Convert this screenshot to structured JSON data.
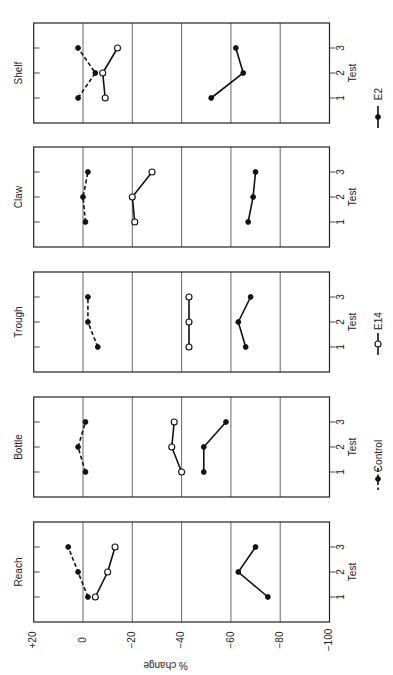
{
  "chart_data": {
    "type": "line",
    "orientation": "rotated-90-clockwise",
    "title": "",
    "ylabel": "% change",
    "xlabel": "Test",
    "ylim": [
      -100,
      20
    ],
    "y_ticks": [
      20,
      0,
      -20,
      -40,
      -60,
      -80,
      -100
    ],
    "y_tick_labels": [
      "+20",
      "0",
      "−20",
      "−40",
      "−60",
      "−80",
      "−100"
    ],
    "x_ticks": [
      1,
      2,
      3
    ],
    "x_tick_labels": [
      "1",
      "2",
      "3"
    ],
    "grid": true,
    "legend_position": "right (rotated bottom)",
    "legend": [
      {
        "name": "Control",
        "style": "dashed",
        "marker": "filled-circle"
      },
      {
        "name": "E14",
        "style": "solid",
        "marker": "open-circle"
      },
      {
        "name": "E2",
        "style": "solid",
        "marker": "filled-circle"
      }
    ],
    "panels": [
      {
        "name": "Shelf",
        "series": [
          {
            "name": "Control",
            "values": [
              2,
              -5,
              2
            ]
          },
          {
            "name": "E14",
            "values": [
              -9,
              -8,
              -14
            ]
          },
          {
            "name": "E2",
            "values": [
              -52,
              -65,
              -62
            ]
          }
        ]
      },
      {
        "name": "Claw",
        "series": [
          {
            "name": "Control",
            "values": [
              -1,
              0,
              -2
            ]
          },
          {
            "name": "E14",
            "values": [
              -21,
              -20,
              -28
            ]
          },
          {
            "name": "E2",
            "values": [
              -67,
              -69,
              -70
            ]
          }
        ]
      },
      {
        "name": "Trough",
        "series": [
          {
            "name": "Control",
            "values": [
              -6,
              -2,
              -2
            ]
          },
          {
            "name": "E14",
            "values": [
              -43,
              -43,
              -43
            ]
          },
          {
            "name": "E2",
            "values": [
              -66,
              -63,
              -68
            ]
          }
        ]
      },
      {
        "name": "Bottle",
        "series": [
          {
            "name": "Control",
            "values": [
              -1,
              2,
              -1
            ]
          },
          {
            "name": "E14",
            "values": [
              -40,
              -36,
              -37
            ]
          },
          {
            "name": "E2",
            "values": [
              -49,
              -49,
              -58
            ]
          }
        ]
      },
      {
        "name": "Reach",
        "series": [
          {
            "name": "Control",
            "values": [
              -2,
              2,
              6
            ]
          },
          {
            "name": "E14",
            "values": [
              -5,
              -10,
              -13
            ]
          },
          {
            "name": "E2",
            "values": [
              -75,
              -63,
              -70
            ]
          }
        ]
      }
    ]
  }
}
